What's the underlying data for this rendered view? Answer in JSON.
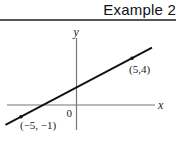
{
  "header": {
    "title": "Example 2"
  },
  "chart_data": {
    "type": "line",
    "title": "",
    "xlabel": "x",
    "ylabel": "y",
    "origin_label": "0",
    "grid": false,
    "xlim": [
      -6.4,
      7
    ],
    "ylim": [
      -2.2,
      5.8
    ],
    "series": [
      {
        "name": "line through two points",
        "x": [
          -6.4,
          6.8
        ],
        "y": [
          -1.7,
          4.9
        ]
      }
    ],
    "points": [
      {
        "x": -5,
        "y": -1,
        "label": "(−5, −1)"
      },
      {
        "x": 5,
        "y": 4,
        "label": "(5,4)"
      }
    ],
    "colors": {
      "line": "#111111",
      "axis": "#777777"
    }
  }
}
